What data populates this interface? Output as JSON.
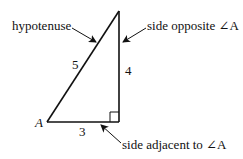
{
  "diagram": {
    "type": "right-triangle",
    "vertex_label": "A",
    "sides": {
      "hypotenuse": "5",
      "opposite": "4",
      "adjacent": "3"
    },
    "annotations": {
      "hypotenuse": "hypotenuse",
      "opposite": "side opposite ∠A",
      "adjacent": "side adjacent to ∠A"
    },
    "colors": {
      "line": "#111111",
      "background": "#ffffff"
    }
  }
}
